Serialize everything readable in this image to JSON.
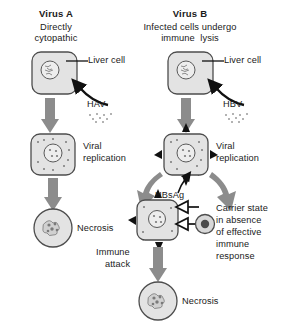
{
  "figure": {
    "title_hidden": "",
    "background": "#ffffff",
    "colors": {
      "arrow_gray": "#8c8c8c",
      "cell_fill": "#e3e3e3",
      "cell_stroke": "#4d4d4d",
      "spike_black": "#111111",
      "text": "#1a1a1a"
    }
  },
  "columns": {
    "left": {
      "heading": "Virus A",
      "subheading_line1": "Directly",
      "subheading_line2": "cytopathic",
      "liver_cell_label": "Liver cell",
      "virus_label": "HAV",
      "replication_line1": "Viral",
      "replication_line2": "replication",
      "outcome_label": "Necrosis"
    },
    "right": {
      "heading": "Virus B",
      "subheading_line1": "Infected cells undergo",
      "subheading_line2": "immune  lysis",
      "liver_cell_label": "Liver cell",
      "virus_label": "HBV",
      "replication_line1": "Viral",
      "replication_line2": "replication",
      "antigen_label": "HBsAg",
      "immune_attack_line1": "Immune",
      "immune_attack_line2": "attack",
      "outcome_label": "Necrosis",
      "carrier_line1": "Carrier state",
      "carrier_line2": "in absence",
      "carrier_line3": "of effective",
      "carrier_line4": "immune",
      "carrier_line5": "response"
    }
  },
  "icons": {
    "liver_cell": "rounded-square-cell-icon",
    "nucleus": "nucleus-icon",
    "necrosis_cell": "circle-necrotic-cell-icon",
    "virus_particles": "virus-particle-dots-icon",
    "hbsag_spike": "black-triangle-spike-icon",
    "antibody": "y-shaped-antibody-icon",
    "lymphocyte": "lymphocyte-circle-icon",
    "arrow_down": "down-arrow-icon",
    "arrow_curve": "curved-arrow-icon",
    "pointer": "pointer-arrow-icon"
  }
}
